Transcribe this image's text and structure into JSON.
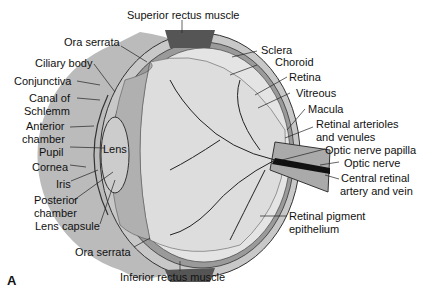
{
  "figure_letter": "A",
  "labels": {
    "superior_rectus": "Superior rectus muscle",
    "ora_serrata_top": "Ora serrata",
    "ciliary_body": "Ciliary body",
    "conjunctiva": "Conjunctiva",
    "canal1": "Canal of",
    "canal2": "Schlemm",
    "anterior1": "Anterior",
    "anterior2": "chamber",
    "pupil": "Pupil",
    "lens": "Lens",
    "cornea": "Cornea",
    "iris": "Iris",
    "posterior1": "Posterior",
    "posterior2": "chamber",
    "lens_capsule": "Lens capsule",
    "ora_serrata_bottom": "Ora serrata",
    "inferior_rectus": "Inferior rectus muscle",
    "sclera": "Sclera",
    "choroid": "Choroid",
    "retina": "Retina",
    "vitreous": "Vitreous",
    "macula": "Macula",
    "arterioles1": "Retinal arterioles",
    "arterioles2": "and venules",
    "optic_papilla": "Optic nerve papilla",
    "optic_nerve": "Optic nerve",
    "central1": "Central retinal",
    "central2": "artery and vein",
    "rpe1": "Retinal pigment",
    "rpe2": "epithelium"
  }
}
